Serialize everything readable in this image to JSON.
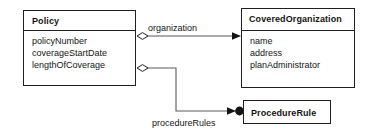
{
  "diagram": {
    "type": "uml-class-diagram",
    "background_color": "#ffffff",
    "line_color": "#231f20",
    "text_color": "#141414",
    "classes": [
      {
        "id": "policy",
        "name": "Policy",
        "attributes": [
          "policyNumber",
          "coverageStartDate",
          "lengthOfCoverage"
        ]
      },
      {
        "id": "covered-organization",
        "name": "CoveredOrganization",
        "attributes": [
          "name",
          "address",
          "planAdministrator"
        ]
      },
      {
        "id": "procedure-rule",
        "name": "ProcedureRule",
        "attributes": []
      }
    ],
    "relationships": [
      {
        "id": "organization",
        "label": "organization",
        "from": "policy",
        "to": "covered-organization",
        "source_decoration": "hollow-diamond",
        "target_decoration": "open-arrow",
        "routing": "straight"
      },
      {
        "id": "procedure-rules",
        "label": "procedureRules",
        "from": "policy",
        "to": "procedure-rule",
        "source_decoration": "hollow-diamond",
        "target_decoration": "open-arrow-filled-circle",
        "routing": "orthogonal-elbow"
      }
    ]
  }
}
